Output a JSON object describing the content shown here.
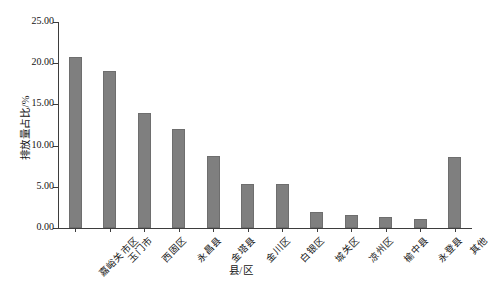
{
  "chart_data": {
    "type": "bar",
    "title": "",
    "xlabel": "县/区",
    "ylabel": "排放量占比/%",
    "categories": [
      "嘉峪关市区",
      "玉门市",
      "西固区",
      "永昌县",
      "金塔县",
      "金川区",
      "白银区",
      "城关区",
      "凉州区",
      "榆中县",
      "永登县",
      "其他"
    ],
    "values": [
      20.7,
      19.1,
      14.0,
      12.0,
      8.7,
      5.4,
      5.3,
      2.0,
      1.6,
      1.3,
      1.1,
      8.6
    ],
    "ylim": [
      0.0,
      25.0
    ],
    "yticks": [
      "0.00",
      "5.00",
      "10.00",
      "15.00",
      "20.00",
      "25.00"
    ],
    "ytick_values": [
      0,
      5,
      10,
      15,
      20,
      25
    ],
    "grid": false,
    "legend": "none",
    "bar_color": "#7f7f7f",
    "axis_color": "#3d3d3d"
  },
  "figure": {
    "caption": ""
  }
}
